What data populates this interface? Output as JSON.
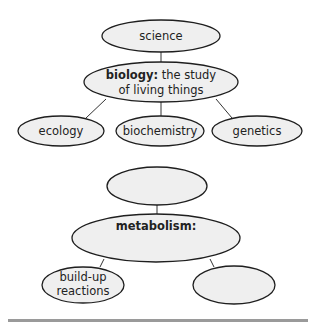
{
  "colors": {
    "node_fill": "#efefef",
    "node_stroke": "#1e1e1e",
    "connector": "#333333",
    "text": "#222222",
    "footer_bar": "#9a9a9a"
  },
  "diagram_1": {
    "root": {
      "label": "science"
    },
    "center": {
      "bold_label": "biology:",
      "label_line1_rest": " the study",
      "label_line2": "of living things"
    },
    "children": [
      {
        "label": "ecology"
      },
      {
        "label": "biochemistry"
      },
      {
        "label": "genetics"
      }
    ]
  },
  "diagram_2": {
    "root": {
      "label": ""
    },
    "center": {
      "bold_label": "metabolism:",
      "label": ""
    },
    "children": [
      {
        "label_line1": "build-up",
        "label_line2": "reactions"
      },
      {
        "label": ""
      }
    ]
  }
}
